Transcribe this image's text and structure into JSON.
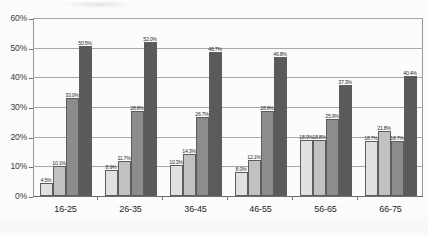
{
  "chart_data": {
    "type": "bar",
    "title": "",
    "subtitle": "",
    "xlabel": "",
    "ylabel": "",
    "ylim": [
      0,
      60
    ],
    "ytick_labels": [
      "0%",
      "10%",
      "20%",
      "30%",
      "40%",
      "50%",
      "60%"
    ],
    "ytick_values": [
      0,
      10,
      20,
      30,
      40,
      50,
      60
    ],
    "grid": true,
    "legend": "none",
    "value_suffix": "%",
    "categories": [
      "16-25",
      "26-35",
      "36-45",
      "46-55",
      "56-65",
      "66-75"
    ],
    "series": [
      {
        "name": "Series 1",
        "color": "#e2e2e2",
        "values": [
          4.5,
          8.9,
          10.3,
          8.0,
          18.9,
          18.7
        ],
        "labels": [
          "4.5%",
          "8.9%",
          "10.3%",
          "8.0%",
          "18.9%",
          "18.7%"
        ]
      },
      {
        "name": "Series 2",
        "color": "#c2c2c2",
        "values": [
          10.1,
          11.7,
          14.3,
          12.1,
          18.8,
          21.8
        ],
        "labels": [
          "10.1%",
          "11.7%",
          "14.3%",
          "12.1%",
          "18.8%",
          "21.8%"
        ]
      },
      {
        "name": "Series 3",
        "color": "#8d8d8d",
        "values": [
          33.0,
          28.8,
          26.7,
          28.8,
          25.9,
          18.7
        ],
        "labels": [
          "33.0%",
          "28.8%",
          "26.7%",
          "28.8%",
          "25.9%",
          "18.7%"
        ]
      },
      {
        "name": "Series 4",
        "color": "#5b5b5b",
        "values": [
          50.5,
          52.0,
          48.7,
          46.8,
          37.3,
          40.4
        ],
        "labels": [
          "50.5%",
          "52.0%",
          "48.7%",
          "46.8%",
          "37.3%",
          "40.4%"
        ]
      }
    ]
  }
}
